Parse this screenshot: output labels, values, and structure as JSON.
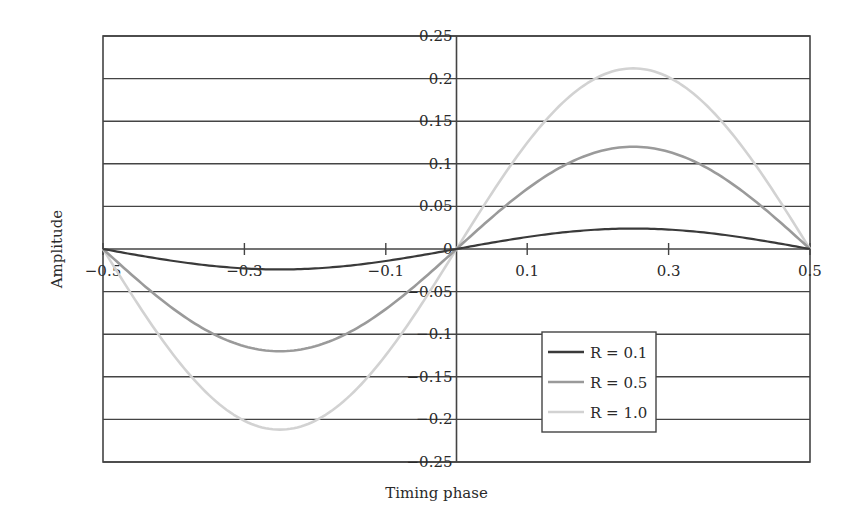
{
  "chart_data": {
    "type": "line",
    "title": "",
    "xlabel": "Timing phase",
    "ylabel": "Amplitude",
    "xlim": [
      -0.5,
      0.5
    ],
    "ylim": [
      -0.25,
      0.25
    ],
    "x_ticks": [
      -0.5,
      -0.3,
      -0.1,
      0.1,
      0.3,
      0.5
    ],
    "x_tick_labels": [
      "−0.5",
      "−0.3",
      "−0.1",
      "0.1",
      "0.3",
      "0.5"
    ],
    "y_ticks": [
      0.25,
      0.2,
      0.15,
      0.1,
      0.05,
      0,
      -0.05,
      -0.1,
      -0.15,
      -0.2,
      -0.25
    ],
    "y_tick_labels": [
      "0.25",
      "0.2",
      "0.15",
      "0.1",
      "0.05",
      "0",
      "−0.05",
      "−0.1",
      "−0.15",
      "−0.2",
      "−0.25"
    ],
    "grid": {
      "horizontal": true,
      "vertical": false
    },
    "legend_position": "lower-right-inside",
    "x": [
      -0.5,
      -0.45,
      -0.4,
      -0.35,
      -0.3,
      -0.25,
      -0.2,
      -0.15,
      -0.1,
      -0.05,
      0,
      0.05,
      0.1,
      0.15,
      0.2,
      0.25,
      0.3,
      0.35,
      0.4,
      0.45,
      0.5
    ],
    "series": [
      {
        "name": "R = 0.1",
        "color": "#3a3a3a",
        "values": [
          0,
          -0.0074,
          -0.0141,
          -0.0194,
          -0.0228,
          -0.024,
          -0.0228,
          -0.0194,
          -0.0141,
          -0.0074,
          0,
          0.0074,
          0.0141,
          0.0194,
          0.0228,
          0.024,
          0.0228,
          0.0194,
          0.0141,
          0.0074,
          0
        ]
      },
      {
        "name": "R = 0.5",
        "color": "#9a9a9a",
        "values": [
          0,
          -0.0371,
          -0.0705,
          -0.0971,
          -0.1141,
          -0.12,
          -0.1141,
          -0.0971,
          -0.0705,
          -0.0371,
          0,
          0.0371,
          0.0705,
          0.0971,
          0.1141,
          0.12,
          0.1141,
          0.0971,
          0.0705,
          0.0371,
          0
        ]
      },
      {
        "name": "R = 1.0",
        "color": "#d2d2d2",
        "values": [
          0,
          -0.0655,
          -0.1246,
          -0.1715,
          -0.2016,
          -0.212,
          -0.2016,
          -0.1715,
          -0.1246,
          -0.0655,
          0,
          0.0655,
          0.1246,
          0.1715,
          0.2016,
          0.212,
          0.2016,
          0.1715,
          0.1246,
          0.0655,
          0
        ]
      }
    ]
  },
  "legend": {
    "items": [
      {
        "label": "R = 0.1",
        "color": "#3a3a3a"
      },
      {
        "label": "R = 0.5",
        "color": "#9a9a9a"
      },
      {
        "label": "R = 1.0",
        "color": "#d2d2d2"
      }
    ]
  },
  "colors": {
    "frame": "#444444",
    "grid": "#444444",
    "text": "#2a2a2a"
  }
}
